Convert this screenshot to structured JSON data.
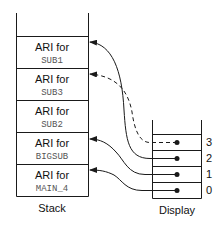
{
  "stack": {
    "label": "Stack",
    "records": [
      {
        "title": "ARI for",
        "name": "SUB1"
      },
      {
        "title": "ARI for",
        "name": "SUB3"
      },
      {
        "title": "ARI for",
        "name": "SUB2"
      },
      {
        "title": "ARI for",
        "name": "BIGSUB"
      },
      {
        "title": "ARI for",
        "name": "MAIN_4"
      }
    ]
  },
  "display": {
    "label": "Display",
    "indices": [
      "3",
      "2",
      "1",
      "0"
    ]
  },
  "colors": {
    "line": "#1a1a1a",
    "text": "#111111",
    "mono_text": "#555555"
  }
}
